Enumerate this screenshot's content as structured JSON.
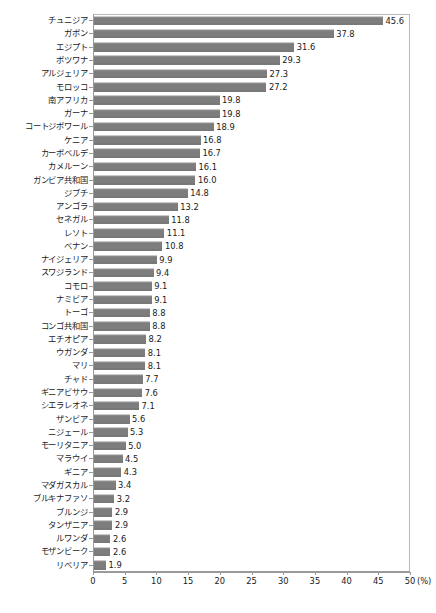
{
  "chart_data": {
    "type": "bar",
    "orientation": "horizontal",
    "title": "",
    "subtitle": "",
    "xlabel": "(%)",
    "ylabel": "",
    "xlim": [
      0,
      50
    ],
    "xticks": [
      0,
      5,
      10,
      15,
      20,
      25,
      30,
      35,
      40,
      45,
      50
    ],
    "xtick_labels": [
      "0",
      "5",
      "10",
      "15",
      "20",
      "25",
      "30",
      "35",
      "40",
      "45",
      "50"
    ],
    "unit_label": "(%)",
    "grid": false,
    "legend": false,
    "bar_color": "#7d7d7d",
    "axis_color": "#9a9a9a",
    "text_color": "#1a1a1a",
    "categories": [
      "チュニジア",
      "ガボン",
      "エジプト",
      "ボツワナ",
      "アルジェリア",
      "モロッコ",
      "南アフリカ",
      "ガーナ",
      "コートジボワール",
      "ケニア",
      "カーボベルデ",
      "カメルーン",
      "ガンビア共和国",
      "ジブチ",
      "アンゴラ",
      "セネガル",
      "レソト",
      "ベナン",
      "ナイジェリア",
      "スワジランド",
      "コモロ",
      "ナミビア",
      "トーゴ",
      "コンゴ共和国",
      "エチオピア",
      "ウガンダ",
      "マリ",
      "チャド",
      "ギニアビサウ",
      "シエラレオネ",
      "ザンビア",
      "ニジェール",
      "モーリタニア",
      "マラウイ",
      "ギニア",
      "マダガスカル",
      "ブルキナファソ",
      "ブルンジ",
      "タンザニア",
      "ルワンダ",
      "モザンビーク",
      "リベリア"
    ],
    "values": [
      45.6,
      37.8,
      31.6,
      29.3,
      27.3,
      27.2,
      19.8,
      19.8,
      18.9,
      16.8,
      16.7,
      16.1,
      16.0,
      14.8,
      13.2,
      11.8,
      11.1,
      10.8,
      9.9,
      9.4,
      9.1,
      9.1,
      8.8,
      8.8,
      8.2,
      8.1,
      8.1,
      7.7,
      7.6,
      7.1,
      5.6,
      5.3,
      5.0,
      4.5,
      4.3,
      3.4,
      3.2,
      2.9,
      2.9,
      2.6,
      2.6,
      1.9
    ],
    "value_labels": [
      "45.6",
      "37.8",
      "31.6",
      "29.3",
      "27.3",
      "27.2",
      "19.8",
      "19.8",
      "18.9",
      "16.8",
      "16.7",
      "16.1",
      "16.0",
      "14.8",
      "13.2",
      "11.8",
      "11.1",
      "10.8",
      "9.9",
      "9.4",
      "9.1",
      "9.1",
      "8.8",
      "8.8",
      "8.2",
      "8.1",
      "8.1",
      "7.7",
      "7.6",
      "7.1",
      "5.6",
      "5.3",
      "5.0",
      "4.5",
      "4.3",
      "3.4",
      "3.2",
      "2.9",
      "2.9",
      "2.6",
      "2.6",
      "1.9"
    ]
  }
}
